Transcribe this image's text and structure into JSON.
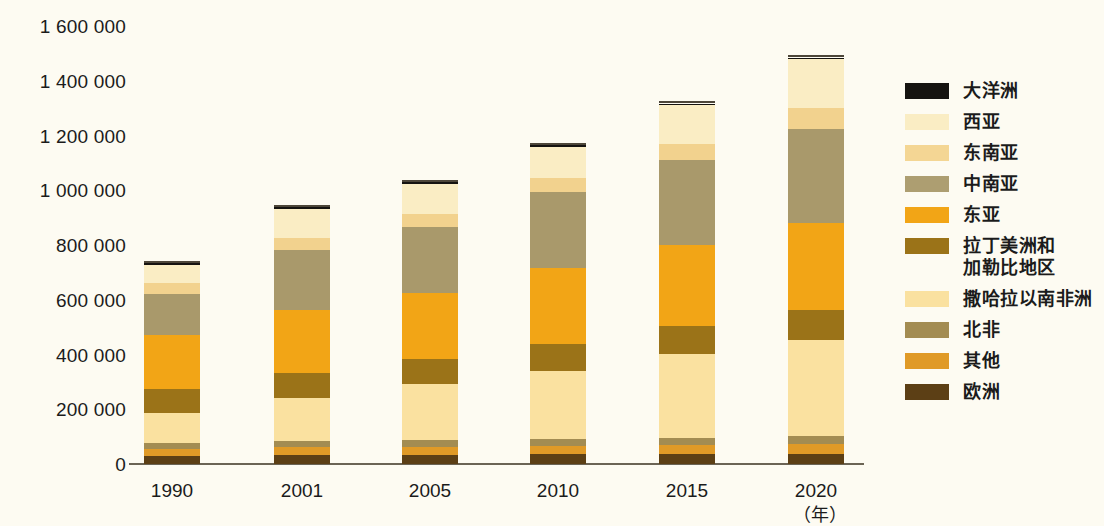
{
  "chart_data": {
    "type": "bar",
    "subtype": "stacked-vertical",
    "title": "",
    "xlabel": "（年）",
    "ylabel": "",
    "ylim": [
      0,
      1600000
    ],
    "ytick_step": 200000,
    "grid": false,
    "legend_position": "right",
    "categories": [
      "1990",
      "2001",
      "2005",
      "2010",
      "2015",
      "2020"
    ],
    "ytick_labels": [
      "0",
      "200 000",
      "400 000",
      "600 000",
      "800 000",
      "1 000 000",
      "1 200 000",
      "1 400 000",
      "1 600 000"
    ],
    "ytick_values": [
      0,
      200000,
      400000,
      600000,
      800000,
      1000000,
      1200000,
      1400000,
      1600000
    ],
    "stack_order_bottom_to_top": [
      "欧洲",
      "其他",
      "北非",
      "撒哈拉以南非洲",
      "拉丁美洲和加勒比地区",
      "东亚",
      "中南亚",
      "东南亚",
      "西亚",
      "大洋洲"
    ],
    "series": [
      {
        "name": "欧洲",
        "color": "#5c3f15",
        "values": [
          29000,
          33000,
          34000,
          35000,
          36000,
          38000
        ]
      },
      {
        "name": "其他",
        "color": "#e09a27",
        "values": [
          26000,
          29000,
          30000,
          31000,
          33000,
          35000
        ]
      },
      {
        "name": "北非",
        "color": "#a38c52",
        "values": [
          20000,
          23000,
          24000,
          26000,
          27000,
          29000
        ]
      },
      {
        "name": "撒哈拉以南非洲",
        "color": "#fae1a0",
        "values": [
          111000,
          158000,
          203000,
          249000,
          306000,
          352000
        ]
      },
      {
        "name": "拉丁美洲和加勒比地区",
        "color": "#9b7318",
        "values": [
          88000,
          91000,
          93000,
          99000,
          102000,
          107000
        ]
      },
      {
        "name": "东亚",
        "color": "#f2a516",
        "values": [
          199000,
          230000,
          240000,
          277000,
          296000,
          318000
        ]
      },
      {
        "name": "中南亚",
        "color": "#a9996b",
        "values": [
          150000,
          217000,
          243000,
          275000,
          310000,
          344000
        ]
      },
      {
        "name": "东南亚",
        "color": "#f2d28e",
        "values": [
          37000,
          45000,
          48000,
          54000,
          59000,
          77000
        ]
      },
      {
        "name": "西亚",
        "color": "#faedc4",
        "values": [
          66000,
          105000,
          109000,
          112000,
          142000,
          178000
        ]
      },
      {
        "name": "大洋洲",
        "color": "#151310",
        "values": [
          7000,
          7000,
          6000,
          7000,
          6000,
          7000
        ]
      }
    ],
    "totals": [
      733000,
      938000,
      1030000,
      1165000,
      1317000,
      1485000
    ]
  },
  "legend": {
    "items": [
      {
        "label": "大洋洲",
        "color": "#151310"
      },
      {
        "label": "西亚",
        "color": "#faedc4"
      },
      {
        "label": "东南亚",
        "color": "#f4d694"
      },
      {
        "label": "中南亚",
        "color": "#ad9e71"
      },
      {
        "label": "东亚",
        "color": "#f2a516"
      },
      {
        "label": "拉丁美洲和\n加勒比地区",
        "color": "#9b7318"
      },
      {
        "label": "撒哈拉以南非洲",
        "color": "#fae1a0"
      },
      {
        "label": "北非",
        "color": "#a38c52"
      },
      {
        "label": "其他",
        "color": "#e09a27"
      },
      {
        "label": "欧洲",
        "color": "#5c3f15"
      }
    ]
  },
  "axis": {
    "unit_label": "（年）"
  }
}
